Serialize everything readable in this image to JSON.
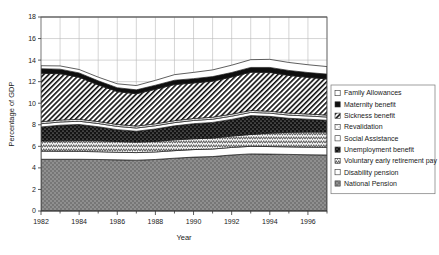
{
  "chart_data": {
    "type": "area",
    "stacked": true,
    "title": "",
    "xlabel": "Year",
    "ylabel": "Percentage of GDP",
    "xlim": [
      1982,
      1997
    ],
    "ylim": [
      0,
      18
    ],
    "ytick_step": 2,
    "yticks": [
      0,
      2,
      4,
      6,
      8,
      10,
      12,
      14,
      16,
      18
    ],
    "xticks_major": [
      1982,
      1984,
      1986,
      1988,
      1990,
      1992,
      1994,
      1996
    ],
    "xticks_minor": [
      1983,
      1985,
      1987,
      1989,
      1991,
      1993,
      1995,
      1997
    ],
    "grid": true,
    "legend_position": "right",
    "x": [
      1982,
      1983,
      1984,
      1985,
      1986,
      1987,
      1988,
      1989,
      1990,
      1991,
      1992,
      1993,
      1994,
      1995,
      1996,
      1997
    ],
    "series": [
      {
        "name": "National Pension",
        "swatch": "gray-dotted",
        "color": "#8a8a8a",
        "values": [
          4.8,
          4.8,
          4.8,
          4.78,
          4.75,
          4.72,
          4.78,
          4.9,
          5.0,
          5.05,
          5.2,
          5.3,
          5.28,
          5.25,
          5.22,
          5.2
        ]
      },
      {
        "name": "Disability pension",
        "swatch": "white-plain",
        "color": "#ffffff",
        "values": [
          0.75,
          0.74,
          0.73,
          0.72,
          0.7,
          0.7,
          0.7,
          0.7,
          0.7,
          0.7,
          0.7,
          0.7,
          0.7,
          0.7,
          0.7,
          0.7
        ]
      },
      {
        "name": "Voluntary early retirement pay",
        "swatch": "zigzag-hatch",
        "color": "#ffffff",
        "values": [
          0.95,
          0.97,
          1.0,
          1.02,
          1.0,
          0.98,
          0.98,
          1.0,
          1.0,
          1.02,
          1.05,
          1.1,
          1.25,
          1.35,
          1.4,
          1.42
        ]
      },
      {
        "name": "Unemployment benefit",
        "swatch": "black-speckle",
        "color": "#1a1a1a",
        "values": [
          1.3,
          1.45,
          1.5,
          1.3,
          1.1,
          1.0,
          1.15,
          1.3,
          1.4,
          1.45,
          1.55,
          1.75,
          1.55,
          1.3,
          1.2,
          1.1
        ]
      },
      {
        "name": "Social Assistance",
        "swatch": "white-plain",
        "color": "#ffffff",
        "values": [
          0.3,
          0.3,
          0.3,
          0.3,
          0.3,
          0.3,
          0.3,
          0.3,
          0.3,
          0.3,
          0.3,
          0.3,
          0.3,
          0.3,
          0.3,
          0.3
        ]
      },
      {
        "name": "Revalidation",
        "swatch": "light-dotted",
        "color": "#e8e8e8",
        "values": [
          0.18,
          0.18,
          0.18,
          0.18,
          0.18,
          0.18,
          0.18,
          0.18,
          0.18,
          0.18,
          0.18,
          0.18,
          0.18,
          0.18,
          0.18,
          0.18
        ]
      },
      {
        "name": "Sickness benefit",
        "swatch": "diagonal-hatch-wide",
        "color": "#ffffff",
        "values": [
          4.5,
          4.3,
          3.9,
          3.4,
          3.05,
          3.0,
          3.2,
          3.35,
          3.3,
          3.35,
          3.45,
          3.55,
          3.6,
          3.5,
          3.4,
          3.35
        ]
      },
      {
        "name": "Maternity benefit",
        "swatch": "black-solid",
        "color": "#111111",
        "values": [
          0.42,
          0.42,
          0.4,
          0.38,
          0.36,
          0.36,
          0.38,
          0.4,
          0.4,
          0.42,
          0.42,
          0.44,
          0.46,
          0.46,
          0.45,
          0.45
        ]
      },
      {
        "name": "Family Allowances",
        "swatch": "white-outline",
        "color": "#ffffff",
        "values": [
          0.28,
          0.3,
          0.32,
          0.34,
          0.36,
          0.4,
          0.45,
          0.52,
          0.58,
          0.62,
          0.68,
          0.72,
          0.75,
          0.74,
          0.72,
          0.7
        ]
      }
    ],
    "legend_entries": [
      {
        "label": "Family Allowances",
        "swatch": "white-outline"
      },
      {
        "label": "Maternity benefit",
        "swatch": "black-solid"
      },
      {
        "label": "Sickness benefit",
        "swatch": "diagonal-hatch-wide"
      },
      {
        "label": "Revalidation",
        "swatch": "light-dotted"
      },
      {
        "label": "Social Assistance",
        "swatch": "white-plain"
      },
      {
        "label": "Unemployment benefit",
        "swatch": "black-speckle"
      },
      {
        "label": "Voluntary early retirement pay",
        "swatch": "zigzag-hatch"
      },
      {
        "label": "Disability pension",
        "swatch": "white-plain"
      },
      {
        "label": "National Pension",
        "swatch": "gray-dotted"
      }
    ]
  }
}
